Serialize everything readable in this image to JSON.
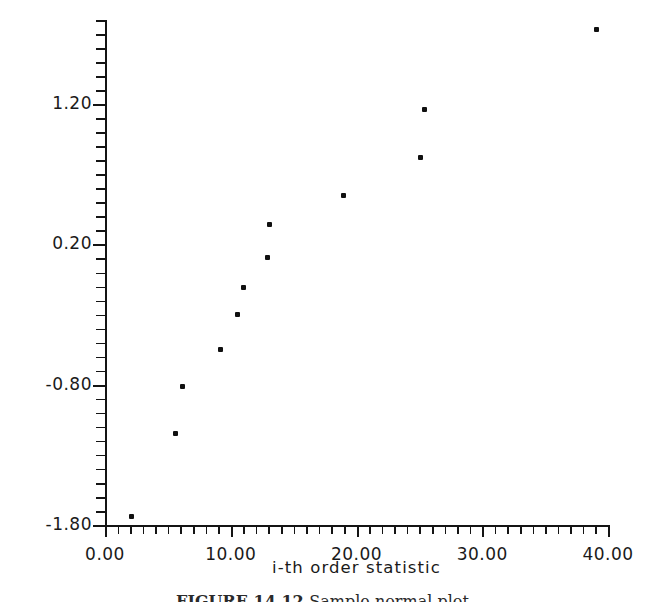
{
  "figure": {
    "caption_label": "FIGURE 14.12",
    "caption_text": "Sample normal plot.",
    "background_color": "#ffffff",
    "ink_color": "#141414"
  },
  "chart_data": {
    "type": "scatter",
    "title": "",
    "xlabel": "i-th order statistic",
    "ylabel": "Standard Normal Quantile",
    "xlim": [
      0.0,
      40.0
    ],
    "ylim": [
      -1.8,
      1.8
    ],
    "grid": false,
    "legend": null,
    "x_tick_labels": [
      "0.00",
      "10.00",
      "20.00",
      "30.00",
      "40.00"
    ],
    "x_tick_values": [
      0.0,
      10.0,
      20.0,
      30.0,
      40.0
    ],
    "x_minor_tick_step": 1.0,
    "y_tick_labels": [
      "1.20",
      "0.20",
      "-0.80",
      "-1.80"
    ],
    "y_tick_values": [
      1.2,
      0.2,
      -0.8,
      -1.8
    ],
    "y_minor_tick_step": 0.1,
    "marker": "filled-square-dot",
    "marker_color": "#101010",
    "points": [
      {
        "x": 2.1,
        "y": -1.74
      },
      {
        "x": 5.6,
        "y": -1.15
      },
      {
        "x": 6.2,
        "y": -0.81
      },
      {
        "x": 9.2,
        "y": -0.55
      },
      {
        "x": 10.5,
        "y": -0.3
      },
      {
        "x": 11.0,
        "y": -0.11
      },
      {
        "x": 12.9,
        "y": 0.11
      },
      {
        "x": 13.1,
        "y": 0.34
      },
      {
        "x": 19.0,
        "y": 0.55
      },
      {
        "x": 25.1,
        "y": 0.82
      },
      {
        "x": 25.4,
        "y": 1.16
      },
      {
        "x": 39.1,
        "y": 1.73
      }
    ]
  }
}
